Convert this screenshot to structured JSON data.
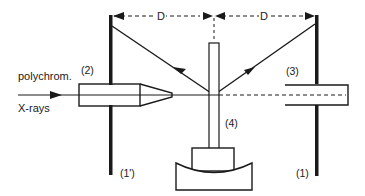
{
  "diagram": {
    "labels": {
      "source_line1": "polychrom.",
      "source_line2": "X-rays",
      "collimator": "(2)",
      "detector_tube": "(3)",
      "sample_holder": "(4)",
      "screen_left": "(1')",
      "screen_right": "(1)",
      "distance_left": "D",
      "distance_right": "D"
    },
    "colors": {
      "stroke": "#1a1a1a",
      "background": "#ffffff"
    }
  }
}
